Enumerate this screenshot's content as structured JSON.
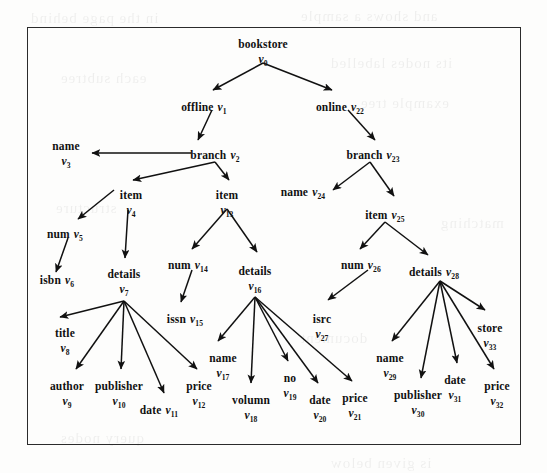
{
  "figure": {
    "caption": "",
    "border_color": "#2b2b2b",
    "background": "#fdfdfc",
    "ink_color": "#111111"
  },
  "tree": {
    "title": "bookstore XML data tree",
    "root_label": "bookstore",
    "nodes": [
      {
        "id": "v0",
        "label": "bookstore",
        "vid": "v",
        "sub": "0",
        "x": 263,
        "y": 38,
        "layout": "stack"
      },
      {
        "id": "v1",
        "label": "offline",
        "vid": "v",
        "sub": "1",
        "x": 204,
        "y": 101,
        "layout": "inline"
      },
      {
        "id": "v22",
        "label": "online",
        "vid": "v",
        "sub": "22",
        "x": 340,
        "y": 101,
        "layout": "inline"
      },
      {
        "id": "v2",
        "label": "branch",
        "vid": "v",
        "sub": "2",
        "x": 215,
        "y": 149,
        "layout": "inline"
      },
      {
        "id": "v23",
        "label": "branch",
        "vid": "v",
        "sub": "23",
        "x": 373,
        "y": 149,
        "layout": "inline"
      },
      {
        "id": "v3",
        "label": "name",
        "vid": "v",
        "sub": "3",
        "x": 66,
        "y": 140,
        "layout": "stack"
      },
      {
        "id": "v24",
        "label": "name",
        "vid": "v",
        "sub": "24",
        "x": 303,
        "y": 186,
        "layout": "inline"
      },
      {
        "id": "v4",
        "label": "item",
        "vid": "v",
        "sub": "4",
        "x": 131,
        "y": 189,
        "layout": "stack"
      },
      {
        "id": "v13",
        "label": "item",
        "vid": "v",
        "sub": "13",
        "x": 227,
        "y": 189,
        "layout": "stack"
      },
      {
        "id": "v25",
        "label": "item",
        "vid": "v",
        "sub": "25",
        "x": 385,
        "y": 209,
        "layout": "inline"
      },
      {
        "id": "v5",
        "label": "num",
        "vid": "v",
        "sub": "5",
        "x": 65,
        "y": 228,
        "layout": "inline"
      },
      {
        "id": "v6",
        "label": "isbn",
        "vid": "v",
        "sub": "6",
        "x": 57,
        "y": 274,
        "layout": "inline"
      },
      {
        "id": "v7",
        "label": "details",
        "vid": "v",
        "sub": "7",
        "x": 124,
        "y": 268,
        "layout": "stack"
      },
      {
        "id": "v14",
        "label": "num",
        "vid": "v",
        "sub": "14",
        "x": 188,
        "y": 259,
        "layout": "inline"
      },
      {
        "id": "v15",
        "label": "issn",
        "vid": "v",
        "sub": "15",
        "x": 185,
        "y": 313,
        "layout": "inline"
      },
      {
        "id": "v16",
        "label": "details",
        "vid": "v",
        "sub": "16",
        "x": 255,
        "y": 265,
        "layout": "stack"
      },
      {
        "id": "v26",
        "label": "num",
        "vid": "v",
        "sub": "26",
        "x": 361,
        "y": 259,
        "layout": "inline"
      },
      {
        "id": "v27",
        "label": "isrc",
        "vid": "v",
        "sub": "27",
        "x": 322,
        "y": 313,
        "layout": "stack"
      },
      {
        "id": "v28",
        "label": "details",
        "vid": "v",
        "sub": "28",
        "x": 434,
        "y": 266,
        "layout": "inline"
      },
      {
        "id": "v8",
        "label": "title",
        "vid": "v",
        "sub": "8",
        "x": 65,
        "y": 327,
        "layout": "stack"
      },
      {
        "id": "v9",
        "label": "author",
        "vid": "v",
        "sub": "9",
        "x": 67,
        "y": 380,
        "layout": "stack"
      },
      {
        "id": "v10",
        "label": "publisher",
        "vid": "v",
        "sub": "10",
        "x": 119,
        "y": 380,
        "layout": "stack"
      },
      {
        "id": "v11",
        "label": "date",
        "vid": "v",
        "sub": "11",
        "x": 159,
        "y": 404,
        "layout": "inline"
      },
      {
        "id": "v12",
        "label": "price",
        "vid": "v",
        "sub": "12",
        "x": 199,
        "y": 380,
        "layout": "stack"
      },
      {
        "id": "v17",
        "label": "name",
        "vid": "v",
        "sub": "17",
        "x": 223,
        "y": 352,
        "layout": "stack"
      },
      {
        "id": "v18",
        "label": "volumn",
        "vid": "v",
        "sub": "18",
        "x": 251,
        "y": 394,
        "layout": "stack"
      },
      {
        "id": "v19",
        "label": "no",
        "vid": "v",
        "sub": "19",
        "x": 290,
        "y": 372,
        "layout": "stack"
      },
      {
        "id": "v20",
        "label": "date",
        "vid": "v",
        "sub": "20",
        "x": 320,
        "y": 394,
        "layout": "stack"
      },
      {
        "id": "v21",
        "label": "price",
        "vid": "v",
        "sub": "21",
        "x": 355,
        "y": 392,
        "layout": "stack"
      },
      {
        "id": "v29",
        "label": "name",
        "vid": "v",
        "sub": "29",
        "x": 390,
        "y": 352,
        "layout": "stack"
      },
      {
        "id": "v30",
        "label": "publisher",
        "vid": "v",
        "sub": "30",
        "x": 418,
        "y": 389,
        "layout": "stack"
      },
      {
        "id": "v31",
        "label": "date",
        "vid": "v",
        "sub": "31",
        "x": 455,
        "y": 374,
        "layout": "stack"
      },
      {
        "id": "v32",
        "label": "price",
        "vid": "v",
        "sub": "32",
        "x": 497,
        "y": 380,
        "layout": "stack"
      },
      {
        "id": "v33",
        "label": "store",
        "vid": "v",
        "sub": "33",
        "x": 490,
        "y": 322,
        "layout": "stack"
      }
    ],
    "edges": [
      {
        "from": "v0",
        "to": "v1",
        "x1": 263,
        "y1": 63,
        "x2": 213,
        "y2": 90
      },
      {
        "from": "v0",
        "to": "v22",
        "x1": 263,
        "y1": 63,
        "x2": 332,
        "y2": 90
      },
      {
        "from": "v1",
        "to": "v2",
        "x1": 212,
        "y1": 110,
        "x2": 198,
        "y2": 140
      },
      {
        "from": "v22",
        "to": "v23",
        "x1": 348,
        "y1": 110,
        "x2": 375,
        "y2": 140
      },
      {
        "from": "v2",
        "to": "v3",
        "x1": 191,
        "y1": 153,
        "x2": 92,
        "y2": 153
      },
      {
        "from": "v2",
        "to": "v4",
        "x1": 215,
        "y1": 162,
        "x2": 133,
        "y2": 180
      },
      {
        "from": "v2",
        "to": "v13",
        "x1": 215,
        "y1": 162,
        "x2": 229,
        "y2": 180
      },
      {
        "from": "v23",
        "to": "v24",
        "x1": 370,
        "y1": 162,
        "x2": 333,
        "y2": 190
      },
      {
        "from": "v23",
        "to": "v25",
        "x1": 370,
        "y1": 162,
        "x2": 394,
        "y2": 196
      },
      {
        "from": "v4",
        "to": "v5",
        "x1": 114,
        "y1": 190,
        "x2": 78,
        "y2": 219
      },
      {
        "from": "v4",
        "to": "v7",
        "x1": 128,
        "y1": 210,
        "x2": 125,
        "y2": 258
      },
      {
        "from": "v5",
        "to": "v6",
        "x1": 68,
        "y1": 238,
        "x2": 56,
        "y2": 272
      },
      {
        "from": "v13",
        "to": "v14",
        "x1": 227,
        "y1": 209,
        "x2": 192,
        "y2": 249
      },
      {
        "from": "v13",
        "to": "v16",
        "x1": 227,
        "y1": 209,
        "x2": 257,
        "y2": 252
      },
      {
        "from": "v14",
        "to": "v15",
        "x1": 192,
        "y1": 270,
        "x2": 181,
        "y2": 302
      },
      {
        "from": "v25",
        "to": "v26",
        "x1": 385,
        "y1": 222,
        "x2": 360,
        "y2": 249
      },
      {
        "from": "v25",
        "to": "v28",
        "x1": 385,
        "y1": 222,
        "x2": 428,
        "y2": 255
      },
      {
        "from": "v26",
        "to": "v27",
        "x1": 368,
        "y1": 270,
        "x2": 328,
        "y2": 300
      },
      {
        "from": "v7",
        "to": "v8",
        "x1": 124,
        "y1": 301,
        "x2": 60,
        "y2": 317
      },
      {
        "from": "v7",
        "to": "v9",
        "x1": 124,
        "y1": 301,
        "x2": 76,
        "y2": 369
      },
      {
        "from": "v7",
        "to": "v10",
        "x1": 124,
        "y1": 301,
        "x2": 121,
        "y2": 369
      },
      {
        "from": "v7",
        "to": "v11",
        "x1": 124,
        "y1": 301,
        "x2": 164,
        "y2": 393
      },
      {
        "from": "v7",
        "to": "v12",
        "x1": 124,
        "y1": 301,
        "x2": 197,
        "y2": 369
      },
      {
        "from": "v16",
        "to": "v17",
        "x1": 255,
        "y1": 297,
        "x2": 218,
        "y2": 341
      },
      {
        "from": "v16",
        "to": "v18",
        "x1": 255,
        "y1": 297,
        "x2": 251,
        "y2": 383
      },
      {
        "from": "v16",
        "to": "v19",
        "x1": 255,
        "y1": 297,
        "x2": 288,
        "y2": 361
      },
      {
        "from": "v16",
        "to": "v20",
        "x1": 255,
        "y1": 297,
        "x2": 318,
        "y2": 383
      },
      {
        "from": "v16",
        "to": "v21",
        "x1": 255,
        "y1": 297,
        "x2": 352,
        "y2": 381
      },
      {
        "from": "v28",
        "to": "v29",
        "x1": 440,
        "y1": 281,
        "x2": 392,
        "y2": 341
      },
      {
        "from": "v28",
        "to": "v30",
        "x1": 440,
        "y1": 281,
        "x2": 421,
        "y2": 378
      },
      {
        "from": "v28",
        "to": "v31",
        "x1": 440,
        "y1": 281,
        "x2": 457,
        "y2": 363
      },
      {
        "from": "v28",
        "to": "v32",
        "x1": 440,
        "y1": 281,
        "x2": 494,
        "y2": 369
      },
      {
        "from": "v28",
        "to": "v33",
        "x1": 440,
        "y1": 281,
        "x2": 485,
        "y2": 310
      }
    ]
  },
  "bleed_through": [
    {
      "text": "in the page behind",
      "x": 30,
      "y": 10
    },
    {
      "text": "and shows a sample",
      "x": 300,
      "y": 8
    },
    {
      "text": "its nodes labelled",
      "x": 330,
      "y": 55
    },
    {
      "text": "each subtree",
      "x": 60,
      "y": 70
    },
    {
      "text": "example tree",
      "x": 360,
      "y": 95
    },
    {
      "text": "structure",
      "x": 55,
      "y": 200
    },
    {
      "text": "matching",
      "x": 440,
      "y": 215
    },
    {
      "text": "document",
      "x": 300,
      "y": 330
    },
    {
      "text": "query nodes",
      "x": 60,
      "y": 430
    },
    {
      "text": "is given below",
      "x": 330,
      "y": 455
    }
  ]
}
